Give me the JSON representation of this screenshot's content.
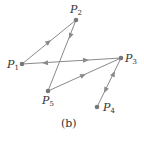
{
  "diagram": {
    "type": "directed-graph",
    "caption": "(b)",
    "colors": {
      "edge": "#8a8a8a",
      "node": "#777777",
      "text": "#333333"
    },
    "nodes": [
      {
        "id": "P1",
        "label": "P",
        "sub": "1",
        "x": 22,
        "y": 64
      },
      {
        "id": "P2",
        "label": "P",
        "sub": "2",
        "x": 76,
        "y": 20
      },
      {
        "id": "P3",
        "label": "P",
        "sub": "3",
        "x": 121,
        "y": 58
      },
      {
        "id": "P4",
        "label": "P",
        "sub": "4",
        "x": 97,
        "y": 107
      },
      {
        "id": "P5",
        "label": "P",
        "sub": "5",
        "x": 48,
        "y": 91
      }
    ],
    "edges": [
      {
        "from": "P1",
        "to": "P2",
        "direction": "forward"
      },
      {
        "from": "P2",
        "to": "P5",
        "direction": "forward"
      },
      {
        "from": "P5",
        "to": "P3",
        "direction": "forward"
      },
      {
        "from": "P1",
        "to": "P3",
        "direction": "both"
      },
      {
        "from": "P3",
        "to": "P4",
        "direction": "both"
      }
    ]
  }
}
